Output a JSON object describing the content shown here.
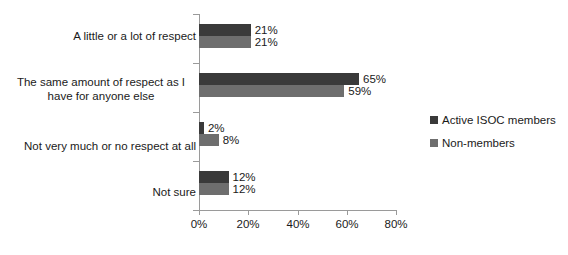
{
  "chart_data": {
    "type": "bar",
    "orientation": "horizontal",
    "title": "",
    "xlabel": "",
    "ylabel": "",
    "xlim": [
      0,
      80
    ],
    "grid": false,
    "legend_position": "right",
    "tick_labels": [
      "0%",
      "20%",
      "40%",
      "60%",
      "80%"
    ],
    "tick_values": [
      0,
      20,
      40,
      60,
      80
    ],
    "categories": [
      "A little or a lot of respect",
      "The same amount of respect as I\nhave for anyone else",
      "Not very much or no respect at all",
      "Not sure"
    ],
    "series": [
      {
        "name": "Active ISOC members",
        "color": "#3a3a3a",
        "values": [
          21,
          65,
          2,
          12
        ],
        "labels": [
          "21%",
          "65%",
          "2%",
          "12%"
        ]
      },
      {
        "name": "Non-members",
        "color": "#6e6e6e",
        "values": [
          21,
          59,
          8,
          12
        ],
        "labels": [
          "21%",
          "59%",
          "8%",
          "12%"
        ]
      }
    ]
  },
  "legend": {
    "items": [
      {
        "label": "Active ISOC members",
        "color": "#3a3a3a"
      },
      {
        "label": "Non-members",
        "color": "#6e6e6e"
      }
    ]
  },
  "axis": {
    "line_color": "#9a9a9a"
  }
}
